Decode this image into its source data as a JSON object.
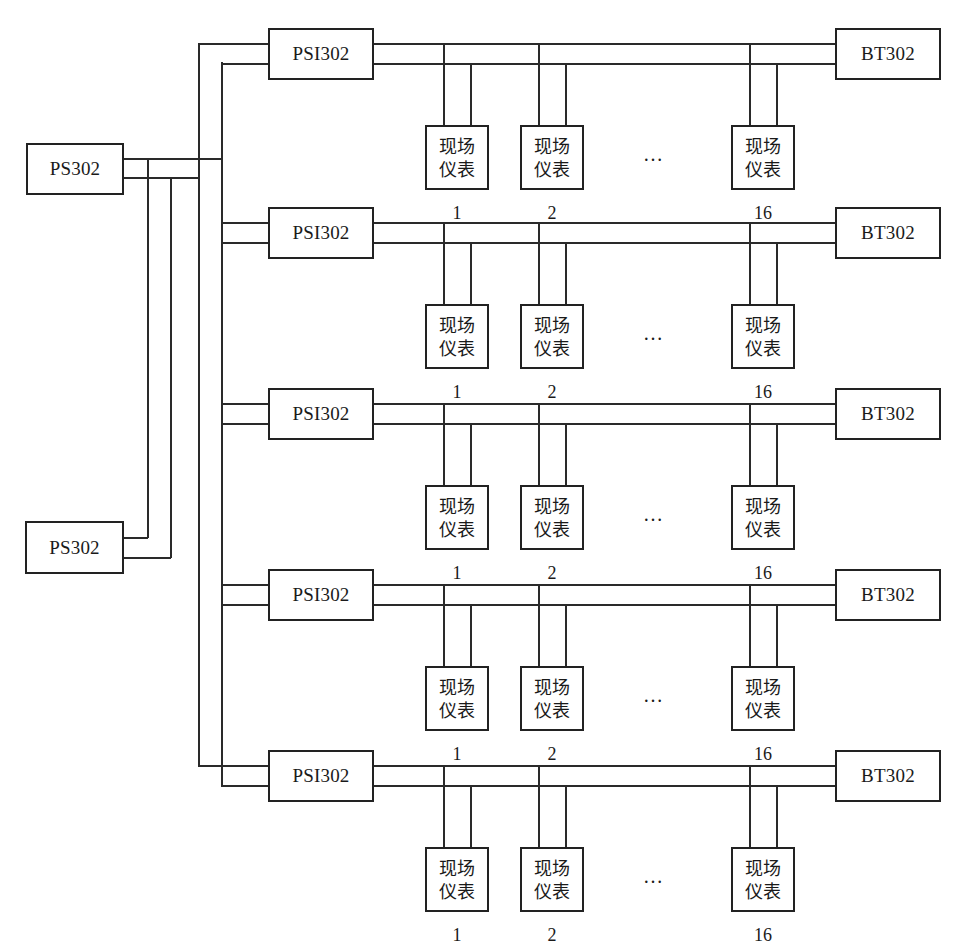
{
  "diagram": {
    "power_supplies": [
      {
        "label": "PS302",
        "id": "ps-1"
      },
      {
        "label": "PS302",
        "id": "ps-2"
      }
    ],
    "rows": [
      {
        "psi": "PSI302",
        "terminator": "BT302",
        "instruments": [
          {
            "text1": "现场",
            "text2": "仪表",
            "num": "1"
          },
          {
            "text1": "现场",
            "text2": "仪表",
            "num": "2"
          },
          {
            "text1": "现场",
            "text2": "仪表",
            "num": "16"
          }
        ],
        "ellipsis": "…"
      },
      {
        "psi": "PSI302",
        "terminator": "BT302",
        "instruments": [
          {
            "text1": "现场",
            "text2": "仪表",
            "num": "1"
          },
          {
            "text1": "现场",
            "text2": "仪表",
            "num": "2"
          },
          {
            "text1": "现场",
            "text2": "仪表",
            "num": "16"
          }
        ],
        "ellipsis": "…"
      },
      {
        "psi": "PSI302",
        "terminator": "BT302",
        "instruments": [
          {
            "text1": "现场",
            "text2": "仪表",
            "num": "1"
          },
          {
            "text1": "现场",
            "text2": "仪表",
            "num": "2"
          },
          {
            "text1": "现场",
            "text2": "仪表",
            "num": "16"
          }
        ],
        "ellipsis": "…"
      },
      {
        "psi": "PSI302",
        "terminator": "BT302",
        "instruments": [
          {
            "text1": "现场",
            "text2": "仪表",
            "num": "1"
          },
          {
            "text1": "现场",
            "text2": "仪表",
            "num": "2"
          },
          {
            "text1": "现场",
            "text2": "仪表",
            "num": "16"
          }
        ],
        "ellipsis": "…"
      },
      {
        "psi": "PSI302",
        "terminator": "BT302",
        "instruments": [
          {
            "text1": "现场",
            "text2": "仪表",
            "num": "1"
          },
          {
            "text1": "现场",
            "text2": "仪表",
            "num": "2"
          },
          {
            "text1": "现场",
            "text2": "仪表",
            "num": "16"
          }
        ],
        "ellipsis": "…"
      }
    ],
    "colors": {
      "line": "#2a2a2a",
      "box_border": "#222222",
      "background": "#ffffff"
    }
  }
}
